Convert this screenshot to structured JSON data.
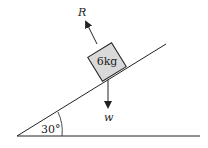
{
  "diagram": {
    "block_label": "6kg",
    "angle_label": "30°",
    "incline_angle_deg": 30,
    "force_normal_label": "R",
    "force_weight_label": "w",
    "block_fill": "#d9d9d9",
    "line_color": "#222222"
  }
}
